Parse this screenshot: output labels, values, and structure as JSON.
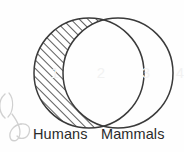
{
  "diagram": {
    "type": "venn",
    "title_visible": false,
    "background_color": "#fefefe",
    "stroke_color": "#3a3a3a",
    "hatch_color": "#555555",
    "number_color": "#f2f2f2",
    "label_color": "#2b2b2b",
    "sets": [
      {
        "id": "left",
        "label": "Humans",
        "shaded": true,
        "shading_style": "diagonal-hatch"
      },
      {
        "id": "right",
        "label": "Mammals",
        "shaded": false,
        "shading_style": "none"
      }
    ],
    "regions": [
      {
        "id": "left-only",
        "number": "1",
        "shaded": true
      },
      {
        "id": "intersection",
        "number": "2",
        "shaded": false
      },
      {
        "id": "right-only",
        "number": "3",
        "shaded": false
      },
      {
        "id": "outside",
        "number": "4",
        "shaded": false
      }
    ],
    "annotation": {
      "id": "pencil-scribble",
      "description": "handwritten-mark"
    }
  }
}
